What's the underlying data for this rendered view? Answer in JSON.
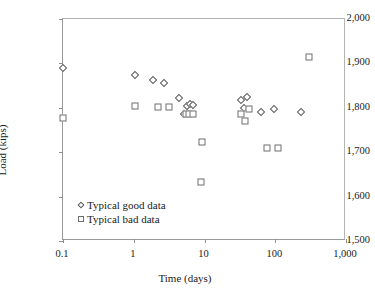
{
  "chart_data": {
    "type": "scatter",
    "title": "",
    "xlabel": "Time (days)",
    "ylabel": "Load (kips)",
    "xscale": "log",
    "yscale": "linear",
    "xlim": [
      0.1,
      1000
    ],
    "ylim": [
      1500,
      2000
    ],
    "xticks": [
      0.1,
      1,
      10,
      100,
      1000
    ],
    "xtick_labels": [
      "0.1",
      "1",
      "10",
      "100",
      "1,000"
    ],
    "yticks": [
      1500,
      1600,
      1700,
      1800,
      1900,
      2000
    ],
    "ytick_labels": [
      "1,500",
      "1,600",
      "1,700",
      "1,800",
      "1,900",
      "2,000"
    ],
    "grid": false,
    "legend_position": "lower left",
    "series": [
      {
        "name": "Typical good data",
        "marker": "diamond",
        "points": [
          {
            "x": 0.1,
            "y": 1890
          },
          {
            "x": 1.05,
            "y": 1873
          },
          {
            "x": 1.9,
            "y": 1862
          },
          {
            "x": 2.7,
            "y": 1855
          },
          {
            "x": 4.3,
            "y": 1822
          },
          {
            "x": 5.6,
            "y": 1805
          },
          {
            "x": 6.3,
            "y": 1808
          },
          {
            "x": 6.9,
            "y": 1806
          },
          {
            "x": 5.1,
            "y": 1786
          },
          {
            "x": 33.0,
            "y": 1818
          },
          {
            "x": 40.0,
            "y": 1824
          },
          {
            "x": 36.0,
            "y": 1800
          },
          {
            "x": 62.0,
            "y": 1790
          },
          {
            "x": 95.0,
            "y": 1797
          },
          {
            "x": 230.0,
            "y": 1790
          }
        ]
      },
      {
        "name": "Typical bad data",
        "marker": "square",
        "points": [
          {
            "x": 0.1,
            "y": 1778
          },
          {
            "x": 1.05,
            "y": 1803
          },
          {
            "x": 2.2,
            "y": 1802
          },
          {
            "x": 3.1,
            "y": 1802
          },
          {
            "x": 5.4,
            "y": 1786
          },
          {
            "x": 6.1,
            "y": 1786
          },
          {
            "x": 6.8,
            "y": 1786
          },
          {
            "x": 9.3,
            "y": 1722
          },
          {
            "x": 9.0,
            "y": 1633
          },
          {
            "x": 33.0,
            "y": 1786
          },
          {
            "x": 42.0,
            "y": 1797
          },
          {
            "x": 37.0,
            "y": 1770
          },
          {
            "x": 77.0,
            "y": 1710
          },
          {
            "x": 110.0,
            "y": 1710
          },
          {
            "x": 300.0,
            "y": 1915
          }
        ]
      }
    ]
  },
  "legend": {
    "items": [
      {
        "label": "Typical good data",
        "marker": "diamond"
      },
      {
        "label": "Typical bad data",
        "marker": "square"
      }
    ]
  }
}
